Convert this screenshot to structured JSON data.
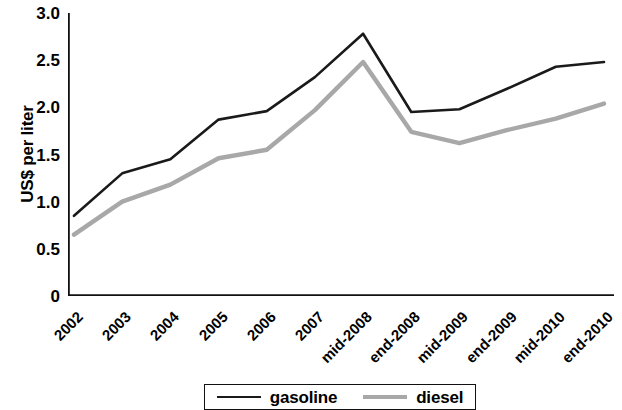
{
  "chart_data": {
    "type": "line",
    "title": "",
    "xlabel": "",
    "ylabel": "US$ per liter",
    "ylim": [
      0,
      3.0
    ],
    "y_ticks": [
      "0",
      "0.5",
      "1.0",
      "1.5",
      "2.0",
      "2.5",
      "3.0"
    ],
    "y_tick_values": [
      0,
      0.5,
      1.0,
      1.5,
      2.0,
      2.5,
      3.0
    ],
    "grid": false,
    "legend_position": "bottom",
    "categories": [
      "2002",
      "2003",
      "2004",
      "2005",
      "2006",
      "2007",
      "mid-2008",
      "end-2008",
      "mid-2009",
      "end-2009",
      "mid-2010",
      "end-2010"
    ],
    "series": [
      {
        "name": "gasoline",
        "color": "#1a1a1a",
        "values": [
          0.85,
          1.3,
          1.45,
          1.87,
          1.96,
          2.32,
          2.78,
          1.95,
          1.98,
          2.2,
          2.43,
          2.48
        ]
      },
      {
        "name": "diesel",
        "color": "#a8a8a8",
        "values": [
          0.65,
          1.0,
          1.18,
          1.46,
          1.55,
          1.97,
          2.48,
          1.74,
          1.62,
          1.76,
          1.88,
          2.04
        ]
      }
    ]
  },
  "legend": {
    "entries": [
      {
        "label": "gasoline",
        "swatch": "solid-black-line"
      },
      {
        "label": "diesel",
        "swatch": "solid-gray-line"
      }
    ]
  }
}
